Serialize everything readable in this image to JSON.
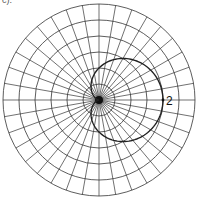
{
  "figure": {
    "caption": "c).",
    "type": "polar-grid-with-cardioid",
    "center": [
      99,
      100
    ],
    "ring_count": 6,
    "ring_spacing_px": 16,
    "radial_line_step_deg": 10,
    "curve": {
      "equation": "r = 1 + cos(theta)",
      "scale_px_per_unit": 32,
      "color": "#222222"
    },
    "labels": [
      {
        "text": "2",
        "theta_deg": 0,
        "r": 2
      }
    ],
    "grid_color": "#333333"
  }
}
